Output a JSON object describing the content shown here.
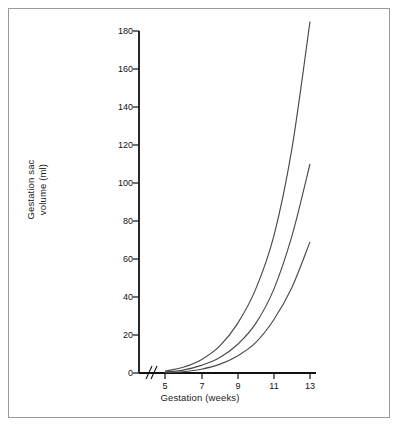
{
  "figure": {
    "background_color": "#ffffff",
    "frame_color": "#9a9a9a",
    "axis_color": "#111111",
    "curve_color": "#4a4a4a"
  },
  "chart_data": {
    "type": "line",
    "title": "",
    "xlabel": "Gestation (weeks)",
    "ylabel": "Gestation sac volume (ml)",
    "ylabel_lines": [
      "Gestation sac",
      "volume (ml)"
    ],
    "xlim": [
      4,
      13
    ],
    "ylim": [
      0,
      180
    ],
    "grid": false,
    "legend": "none",
    "x_axis_break": true,
    "x_axis_break_label": "0",
    "xticks": [
      5,
      7,
      9,
      11,
      13
    ],
    "xtick_labels": [
      "5",
      "7",
      "9",
      "11",
      "13"
    ],
    "yticks": [
      0,
      20,
      40,
      60,
      80,
      100,
      120,
      140,
      160,
      180
    ],
    "ytick_labels": [
      "0",
      "20",
      "40",
      "60",
      "80",
      "100",
      "120",
      "140",
      "160",
      "180"
    ],
    "x": [
      5,
      6,
      7,
      8,
      9,
      10,
      11,
      12,
      13
    ],
    "series": [
      {
        "name": "upper",
        "values": [
          1,
          3,
          7,
          14,
          26,
          44,
          72,
          118,
          185
        ]
      },
      {
        "name": "middle",
        "values": [
          0.5,
          1.5,
          4,
          8,
          15,
          26,
          44,
          72,
          110
        ]
      },
      {
        "name": "lower",
        "values": [
          0.2,
          0.7,
          2,
          4.5,
          9,
          16,
          28,
          45,
          69
        ]
      }
    ]
  }
}
